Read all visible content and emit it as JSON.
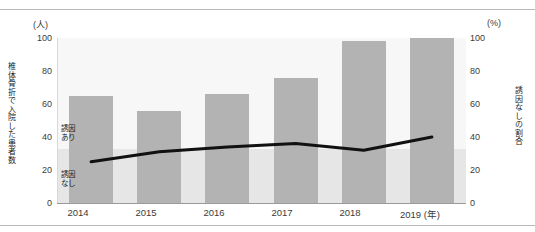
{
  "chart_data": {
    "type": "bar",
    "title": "",
    "subtitle": "",
    "categories": [
      "2014",
      "2015",
      "2016",
      "2017",
      "2018",
      "2019"
    ],
    "xlabel": "(年)",
    "left_axis": {
      "unit": "(人)",
      "title": "椎体骨折で入院した患者数",
      "ticks": [
        "0",
        "20",
        "40",
        "60",
        "80",
        "100"
      ],
      "ylim": [
        0,
        100
      ]
    },
    "right_axis": {
      "unit": "(%)",
      "title": "誘因なしの割合",
      "ticks": [
        "0",
        "20",
        "40",
        "60",
        "80",
        "100"
      ],
      "ylim": [
        0,
        100
      ]
    },
    "series": [
      {
        "name": "椎体骨折で入院した患者数",
        "type": "bar",
        "axis": "left",
        "color": "#b3b3b3",
        "values": [
          65,
          56,
          66,
          76,
          98,
          100
        ]
      },
      {
        "name": "誘因なしの割合",
        "type": "line",
        "axis": "right",
        "color": "#111111",
        "values": [
          25,
          31,
          34,
          36,
          32,
          40
        ]
      }
    ],
    "annotations": [
      {
        "name": "誘因あり",
        "text": "誘因\nあり",
        "line1": "誘因",
        "line2": "あり"
      },
      {
        "name": "誘因なし",
        "text": "誘因\nなし",
        "line1": "誘因",
        "line2": "なし"
      }
    ],
    "grid": false,
    "legend_position": "none",
    "plot_background": "#f7f7f7",
    "bar_color": "#b3b3b3",
    "line_color": "#111111"
  },
  "axes": {
    "left_unit": "(人)",
    "right_unit": "(%)",
    "left_title": "椎体骨折で入院した患者数",
    "right_title": "誘因なしの割合",
    "x_unit": "(年)"
  },
  "yticks": {
    "t0": "0",
    "t20": "20",
    "t40": "40",
    "t60": "60",
    "t80": "80",
    "t100": "100"
  },
  "xticks": {
    "x0": "2014",
    "x1": "2015",
    "x2": "2016",
    "x3": "2017",
    "x4": "2018",
    "x5": "2019 (年)"
  },
  "inbar": {
    "ari_line1": "誘因",
    "ari_line2": "あり",
    "nashi_line1": "誘因",
    "nashi_line2": "なし"
  }
}
